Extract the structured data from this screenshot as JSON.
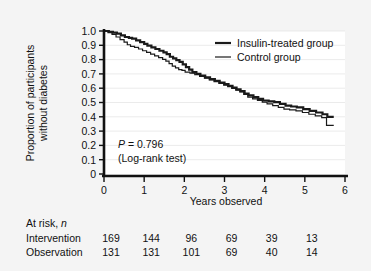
{
  "figure": {
    "background_color": "#f4f4f4",
    "plot_background_color": "#ffffff",
    "axis_color": "#000000",
    "grid_color": "#e3e3e3"
  },
  "chart_data": {
    "type": "line",
    "subtype": "kaplan-meier-survival",
    "title": "",
    "xlabel": "Years observed",
    "ylabel": "Proportion of participants without diabetes",
    "xlim": [
      0,
      6
    ],
    "ylim": [
      0,
      1.0
    ],
    "xticks": [
      0,
      1,
      2,
      3,
      4,
      5,
      6
    ],
    "xticklabels": [
      "0",
      "1",
      "2",
      "3",
      "4",
      "5",
      "6"
    ],
    "yticks": [
      0,
      0.1,
      0.2,
      0.3,
      0.4,
      0.5,
      0.6,
      0.7,
      0.8,
      0.9,
      1.0
    ],
    "yticklabels": [
      "0",
      "0.1",
      "0.2",
      "0.3",
      "0.4",
      "0.5",
      "0.6",
      "0.7",
      "0.8",
      "0.9",
      "1.0"
    ],
    "grid": "horizontal",
    "legend_position": "top-right",
    "series": [
      {
        "name": "Insulin-treated group",
        "line_width": 2.2,
        "color": "#1a1a1a",
        "step": "post",
        "points": [
          [
            0.0,
            1.0
          ],
          [
            0.12,
            0.994
          ],
          [
            0.22,
            0.988
          ],
          [
            0.32,
            0.982
          ],
          [
            0.42,
            0.97
          ],
          [
            0.52,
            0.958
          ],
          [
            0.62,
            0.952
          ],
          [
            0.7,
            0.946
          ],
          [
            0.8,
            0.934
          ],
          [
            0.9,
            0.922
          ],
          [
            1.0,
            0.91
          ],
          [
            1.08,
            0.898
          ],
          [
            1.18,
            0.886
          ],
          [
            1.28,
            0.874
          ],
          [
            1.38,
            0.862
          ],
          [
            1.48,
            0.85
          ],
          [
            1.56,
            0.838
          ],
          [
            1.64,
            0.82
          ],
          [
            1.72,
            0.808
          ],
          [
            1.8,
            0.796
          ],
          [
            1.88,
            0.784
          ],
          [
            1.96,
            0.766
          ],
          [
            2.04,
            0.748
          ],
          [
            2.12,
            0.73
          ],
          [
            2.2,
            0.712
          ],
          [
            2.3,
            0.7
          ],
          [
            2.4,
            0.688
          ],
          [
            2.52,
            0.676
          ],
          [
            2.64,
            0.664
          ],
          [
            2.76,
            0.652
          ],
          [
            2.88,
            0.64
          ],
          [
            3.0,
            0.628
          ],
          [
            3.1,
            0.616
          ],
          [
            3.2,
            0.604
          ],
          [
            3.3,
            0.592
          ],
          [
            3.4,
            0.58
          ],
          [
            3.5,
            0.562
          ],
          [
            3.6,
            0.55
          ],
          [
            3.72,
            0.538
          ],
          [
            3.84,
            0.526
          ],
          [
            3.96,
            0.514
          ],
          [
            4.1,
            0.508
          ],
          [
            4.24,
            0.502
          ],
          [
            4.38,
            0.49
          ],
          [
            4.52,
            0.478
          ],
          [
            4.66,
            0.472
          ],
          [
            4.8,
            0.466
          ],
          [
            4.96,
            0.454
          ],
          [
            5.12,
            0.442
          ],
          [
            5.28,
            0.43
          ],
          [
            5.44,
            0.418
          ],
          [
            5.56,
            0.4
          ],
          [
            5.72,
            0.4
          ]
        ]
      },
      {
        "name": "Control group",
        "line_width": 1.2,
        "color": "#1a1a1a",
        "step": "post",
        "points": [
          [
            0.0,
            1.0
          ],
          [
            0.1,
            0.988
          ],
          [
            0.2,
            0.976
          ],
          [
            0.3,
            0.958
          ],
          [
            0.4,
            0.94
          ],
          [
            0.5,
            0.922
          ],
          [
            0.58,
            0.904
          ],
          [
            0.66,
            0.892
          ],
          [
            0.76,
            0.886
          ],
          [
            0.86,
            0.874
          ],
          [
            0.96,
            0.862
          ],
          [
            1.06,
            0.85
          ],
          [
            1.16,
            0.838
          ],
          [
            1.26,
            0.826
          ],
          [
            1.36,
            0.814
          ],
          [
            1.46,
            0.802
          ],
          [
            1.54,
            0.79
          ],
          [
            1.62,
            0.772
          ],
          [
            1.7,
            0.754
          ],
          [
            1.78,
            0.742
          ],
          [
            1.86,
            0.73
          ],
          [
            1.94,
            0.724
          ],
          [
            2.02,
            0.712
          ],
          [
            2.14,
            0.706
          ],
          [
            2.26,
            0.694
          ],
          [
            2.38,
            0.682
          ],
          [
            2.5,
            0.67
          ],
          [
            2.62,
            0.658
          ],
          [
            2.74,
            0.646
          ],
          [
            2.86,
            0.634
          ],
          [
            2.98,
            0.622
          ],
          [
            3.08,
            0.61
          ],
          [
            3.18,
            0.598
          ],
          [
            3.28,
            0.586
          ],
          [
            3.38,
            0.574
          ],
          [
            3.48,
            0.556
          ],
          [
            3.58,
            0.538
          ],
          [
            3.7,
            0.526
          ],
          [
            3.82,
            0.514
          ],
          [
            3.94,
            0.502
          ],
          [
            4.06,
            0.49
          ],
          [
            4.2,
            0.478
          ],
          [
            4.34,
            0.466
          ],
          [
            4.48,
            0.454
          ],
          [
            4.62,
            0.448
          ],
          [
            4.78,
            0.442
          ],
          [
            4.94,
            0.43
          ],
          [
            5.1,
            0.418
          ],
          [
            5.26,
            0.406
          ],
          [
            5.42,
            0.394
          ],
          [
            5.54,
            0.34
          ],
          [
            5.72,
            0.34
          ]
        ]
      }
    ],
    "annotations": [
      {
        "text_italic": "P",
        "text": " = 0.796",
        "x": 0.45,
        "y": 0.22
      },
      {
        "text": "(Log-rank test)",
        "x": 0.45,
        "y": 0.135
      }
    ]
  },
  "legend": {
    "entries": [
      {
        "label": "Insulin-treated group",
        "line_width": 2.2
      },
      {
        "label": "Control group",
        "line_width": 1.2
      }
    ]
  },
  "risk_table": {
    "title_main": "At risk, ",
    "title_italic": "n",
    "rows": [
      {
        "label": "Intervention",
        "values": [
          "169",
          "144",
          "96",
          "69",
          "39",
          "13"
        ]
      },
      {
        "label": "Observation",
        "values": [
          "131",
          "131",
          "101",
          "69",
          "40",
          "14"
        ]
      }
    ]
  }
}
